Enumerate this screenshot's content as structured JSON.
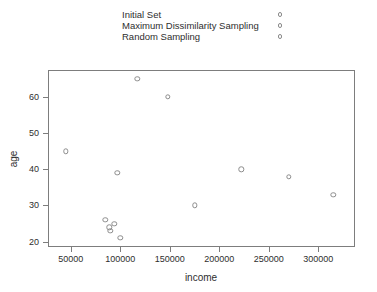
{
  "chart_data": {
    "type": "scatter",
    "title": "",
    "xlabel": "income",
    "ylabel": "age",
    "xlim": [
      27000,
      337000
    ],
    "ylim": [
      18.5,
      67.5
    ],
    "xticks": [
      50000,
      100000,
      150000,
      200000,
      250000,
      300000
    ],
    "xticklabels": [
      "50000",
      "100000",
      "150000",
      "200000",
      "250000",
      "300000"
    ],
    "yticks": [
      20,
      30,
      40,
      50,
      60
    ],
    "yticklabels": [
      "20",
      "30",
      "40",
      "50",
      "60"
    ],
    "grid": false,
    "marker": "open-circle",
    "marker_color": "#8c8c8c",
    "legend_position": "top",
    "legend": [
      {
        "label": "Initial Set",
        "marker": "open-circle"
      },
      {
        "label": "Maximum Dissimilarity Sampling",
        "marker": "open-circle"
      },
      {
        "label": "Random Sampling",
        "marker": "open-circle"
      }
    ],
    "points": [
      {
        "x": 45000,
        "y": 45
      },
      {
        "x": 85000,
        "y": 26
      },
      {
        "x": 89000,
        "y": 24
      },
      {
        "x": 90000,
        "y": 23
      },
      {
        "x": 94000,
        "y": 25
      },
      {
        "x": 97000,
        "y": 39
      },
      {
        "x": 100000,
        "y": 21
      },
      {
        "x": 117000,
        "y": 65
      },
      {
        "x": 148000,
        "y": 60
      },
      {
        "x": 175000,
        "y": 30
      },
      {
        "x": 222000,
        "y": 40
      },
      {
        "x": 270000,
        "y": 38
      },
      {
        "x": 315000,
        "y": 33
      }
    ]
  }
}
